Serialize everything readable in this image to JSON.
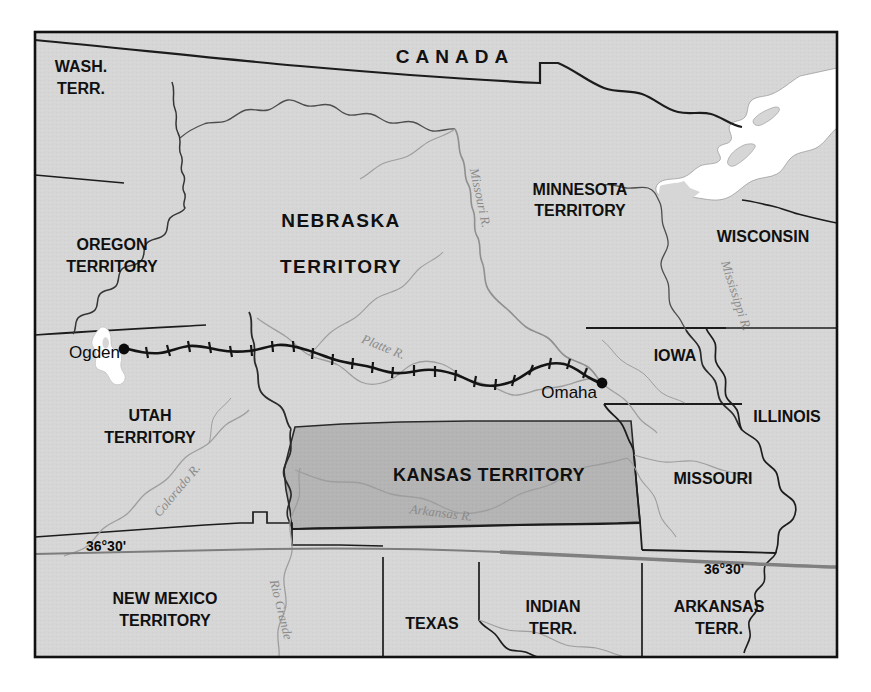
{
  "map": {
    "title": "Kansas-Nebraska Act Territorial Map, 1854",
    "frame": {
      "x": 34,
      "y": 31,
      "width": 804,
      "height": 627
    },
    "colors": {
      "land": "#d6d6d6",
      "highlight": "#b4b4b4",
      "water": "#ffffff",
      "border_dark": "#1a1a1a",
      "border_light": "#6e6e6e",
      "river": "#9a9a9a",
      "railroad": "#141414",
      "lat_line": "#7d7d7d",
      "background": "#ffffff"
    },
    "regions": [
      {
        "id": "canada",
        "label": "CANADA",
        "x": 455,
        "y": 58,
        "size": 19,
        "letter_spacing": 6,
        "lines": [
          "CANADA"
        ],
        "shaded": false
      },
      {
        "id": "wash-terr",
        "label": "WASH. TERR.",
        "x": 81,
        "y": 76,
        "size": 16,
        "letter_spacing": 0,
        "lines": [
          "WASH.",
          "TERR."
        ],
        "shaded": false
      },
      {
        "id": "oregon-terr",
        "label": "OREGON TERRITORY",
        "x": 112,
        "y": 254,
        "size": 16,
        "letter_spacing": 0,
        "lines": [
          "OREGON",
          "TERRITORY"
        ],
        "shaded": false
      },
      {
        "id": "nebraska-terr",
        "label": "NEBRASKA TERRITORY",
        "x": 341,
        "y": 222,
        "size": 19,
        "letter_spacing": 1.5,
        "lines": [
          "NEBRASKA",
          "TERRITORY"
        ],
        "shaded": false
      },
      {
        "id": "minnesota-terr",
        "label": "MINNESOTA TERRITORY",
        "x": 580,
        "y": 196,
        "size": 16,
        "letter_spacing": 0,
        "lines": [
          "MINNESOTA",
          "TERRITORY"
        ],
        "shaded": false
      },
      {
        "id": "wisconsin",
        "label": "WISCONSIN",
        "x": 763,
        "y": 238,
        "size": 16,
        "letter_spacing": 0,
        "lines": [
          "WISCONSIN"
        ],
        "shaded": false
      },
      {
        "id": "iowa",
        "label": "IOWA",
        "x": 675,
        "y": 357,
        "size": 16,
        "letter_spacing": 0,
        "lines": [
          "IOWA"
        ],
        "shaded": false
      },
      {
        "id": "illinois",
        "label": "ILLINOIS",
        "x": 787,
        "y": 418,
        "size": 16,
        "letter_spacing": 0,
        "lines": [
          "ILLINOIS"
        ],
        "shaded": false
      },
      {
        "id": "utah-terr",
        "label": "UTAH TERRITORY",
        "x": 150,
        "y": 417,
        "size": 16,
        "letter_spacing": 0,
        "lines": [
          "UTAH",
          "TERRITORY"
        ],
        "shaded": false
      },
      {
        "id": "kansas-terr",
        "label": "KANSAS TERRITORY",
        "x": 489,
        "y": 476,
        "size": 18,
        "letter_spacing": 0.5,
        "lines": [
          "KANSAS TERRITORY"
        ],
        "shaded": true
      },
      {
        "id": "missouri",
        "label": "MISSOURI",
        "x": 713,
        "y": 480,
        "size": 16,
        "letter_spacing": 0,
        "lines": [
          "MISSOURI"
        ],
        "shaded": false
      },
      {
        "id": "new-mexico-terr",
        "label": "NEW MEXICO TERRITORY",
        "x": 165,
        "y": 604,
        "size": 16,
        "letter_spacing": 0,
        "lines": [
          "NEW MEXICO",
          "TERRITORY"
        ],
        "shaded": false
      },
      {
        "id": "texas",
        "label": "TEXAS",
        "x": 432,
        "y": 625,
        "size": 16,
        "letter_spacing": 0,
        "lines": [
          "TEXAS"
        ],
        "shaded": false
      },
      {
        "id": "indian-terr",
        "label": "INDIAN TERR.",
        "x": 553,
        "y": 613,
        "size": 16,
        "letter_spacing": 0,
        "lines": [
          "INDIAN",
          "TERR."
        ],
        "shaded": false
      },
      {
        "id": "arkansas-terr",
        "label": "ARKANSAS TERR.",
        "x": 719,
        "y": 613,
        "size": 16,
        "letter_spacing": 0,
        "lines": [
          "ARKANSAS",
          "TERR."
        ],
        "shaded": false
      }
    ],
    "rivers": [
      {
        "id": "missouri-river",
        "label": "Missouri R.",
        "x": 479,
        "y": 198,
        "size": 13,
        "rotate": 78
      },
      {
        "id": "mississippi-river",
        "label": "Mississippi R.",
        "x": 735,
        "y": 296,
        "size": 13,
        "rotate": 72
      },
      {
        "id": "platte-river",
        "label": "Platte R.",
        "x": 383,
        "y": 348,
        "size": 13,
        "rotate": 22
      },
      {
        "id": "colorado-river",
        "label": "Colorado R.",
        "x": 178,
        "y": 491,
        "size": 13,
        "rotate": -50
      },
      {
        "id": "arkansas-river",
        "label": "Arkansas R.",
        "x": 441,
        "y": 514,
        "size": 13,
        "rotate": 7
      },
      {
        "id": "rio-grande-river",
        "label": "Rio Grande",
        "x": 280,
        "y": 610,
        "size": 13,
        "rotate": 76
      }
    ],
    "cities": [
      {
        "id": "ogden",
        "label": "Ogden",
        "dot_x": 124,
        "dot_y": 349,
        "label_x": 119,
        "label_y": 354,
        "size": 17
      },
      {
        "id": "omaha",
        "label": "Omaha",
        "dot_x": 602,
        "dot_y": 383,
        "label_x": 597,
        "label_y": 394,
        "size": 17
      }
    ],
    "lat_lines": [
      {
        "id": "lat-36-30-west",
        "label": "36°30'",
        "x": 106,
        "y": 547,
        "size": 14
      },
      {
        "id": "lat-36-30-east",
        "label": "36°30'",
        "x": 724,
        "y": 570,
        "size": 14
      }
    ],
    "railroad": {
      "id": "transcontinental-railroad",
      "name": "railroad-line",
      "description": "Railroad route from Ogden to Omaha with crosstie ticks"
    },
    "water_bodies": [
      {
        "id": "great-salt-lake",
        "name": "great-salt-lake"
      },
      {
        "id": "lake-superior",
        "name": "lake-superior"
      }
    ]
  }
}
